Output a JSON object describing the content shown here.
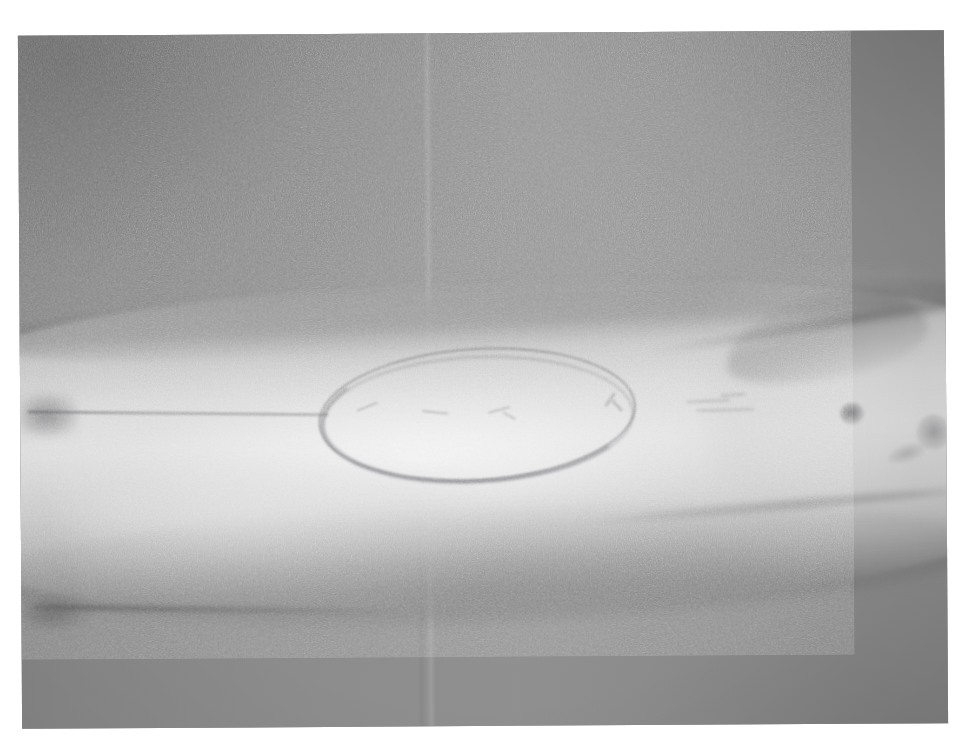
{
  "document": {
    "kind": "clinical-photograph",
    "subject": "forearm-with-surgical-marking",
    "orientation": "landscape",
    "border": "white-photo-border"
  },
  "photo": {
    "title": "Clinical photograph of a limb with a drawn elliptical excision marking",
    "alt_text": "Grainy low-contrast greyscale photograph showing a horizontally oriented forearm against a plain grey backdrop. A surgical pen ellipse is drawn on the skin in the centre, with a thin horizontal guide line extending from the left apex of the ellipse toward the left edge of the frame. Two small dark skin lesions are visible to the right of the ellipse.",
    "frame": {
      "left": 20,
      "top": 33,
      "width": 926,
      "height": 693
    }
  },
  "colors": {
    "page_background": "#ffffff",
    "backdrop_grey": "#8b8b8b",
    "backdrop_dark": "#6f6f6f",
    "skin_midtone": "#b8b8b8",
    "skin_highlight": "#e0e0e0",
    "marking_ink": "#5c5c64",
    "lesion_dark": "#3e3e42",
    "crease_shadow": "#4e4e4e"
  },
  "features": {
    "marking": {
      "name": "elliptical excision outline",
      "shape": "ellipse",
      "center_x": 457,
      "center_y": 381,
      "width": 318,
      "height": 133,
      "rotation_deg": -3.2,
      "stroke_passes": 2
    },
    "guide_line": {
      "name": "horizontal axis guide line",
      "from_x": 8,
      "to_x": 308,
      "y": 377
    },
    "lesions": [
      {
        "name": "lesion-upper",
        "x": 832,
        "y": 383,
        "size": "small"
      },
      {
        "name": "lesion-lateral",
        "x": 913,
        "y": 402,
        "size": "small"
      },
      {
        "name": "lesion-faint",
        "x": 886,
        "y": 423,
        "size": "faint"
      }
    ],
    "creases": [
      {
        "name": "lower-left-skin-fold",
        "y": 575
      },
      {
        "name": "mid-right-contour",
        "y": 472
      },
      {
        "name": "upper-right-contour",
        "y": 294
      }
    ],
    "backdrop_seams": [
      {
        "name": "vertical-seam-upper",
        "x": 409
      },
      {
        "name": "vertical-seam-lower",
        "x": 399
      }
    ]
  }
}
